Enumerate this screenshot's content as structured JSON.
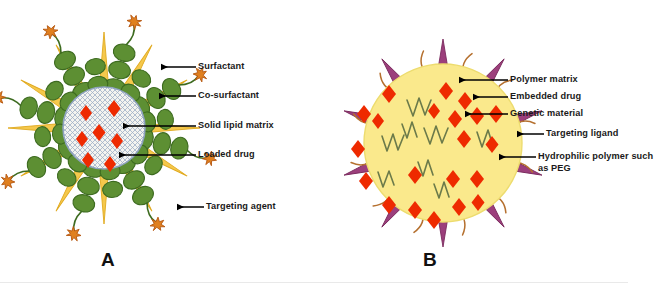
{
  "figure": {
    "background": "#ffffff",
    "panels": [
      {
        "id": "A",
        "letter": "A",
        "title": "Solid lipid nanoparticle",
        "core_label": "solid-lipid-matrix-core",
        "colors": {
          "core_fill": "#f2f2ee",
          "core_hatch": "#9aa8bd",
          "core_stroke": "#8fa3bf",
          "drug": "#ee2a00",
          "surfactant_head": "#4b7f2a",
          "surfactant_head_fill": "#5d8f33",
          "co_surfactant": "#f2c03c",
          "targeting_agent": "#d9741a",
          "chain": "#4b7f2a"
        },
        "counts": {
          "loaded_drug": 7,
          "surfactant_chains": 16,
          "co_surfactant_spikes": 12,
          "targeting_agents": 12
        },
        "labels": [
          {
            "text": "Surfactant",
            "name": "label-surfactant"
          },
          {
            "text": "Co-surfactant",
            "name": "label-co-surfactant"
          },
          {
            "text": "Solid lipid matrix",
            "name": "label-solid-lipid-matrix"
          },
          {
            "text": "Loaded drug",
            "name": "label-loaded-drug"
          },
          {
            "text": "Targeting agent",
            "name": "label-targeting-agent"
          }
        ]
      },
      {
        "id": "B",
        "letter": "B",
        "title": "Polymeric nanoparticle",
        "core_label": "polymer-matrix-core",
        "colors": {
          "core_fill": "#fae98c",
          "core_stroke": "#efdc72",
          "drug": "#ee2a00",
          "genetic_material": "#6b7a4a",
          "targeting_ligand": "#9c3f7c",
          "hydrophilic_polymer": "#b5702f"
        },
        "counts": {
          "embedded_drug": 21,
          "genetic_material": 8,
          "targeting_ligands": 10,
          "peg_chains": 12
        },
        "labels": [
          {
            "text": "Polymer matrix",
            "name": "label-polymer-matrix"
          },
          {
            "text": "Embedded drug",
            "name": "label-embedded-drug"
          },
          {
            "text": "Genetic material",
            "name": "label-genetic-material"
          },
          {
            "text": "Targeting ligand",
            "name": "label-targeting-ligand"
          },
          {
            "text": "Hydrophilic polymer such as PEG",
            "name": "label-hydrophilic-polymer"
          }
        ]
      }
    ]
  }
}
